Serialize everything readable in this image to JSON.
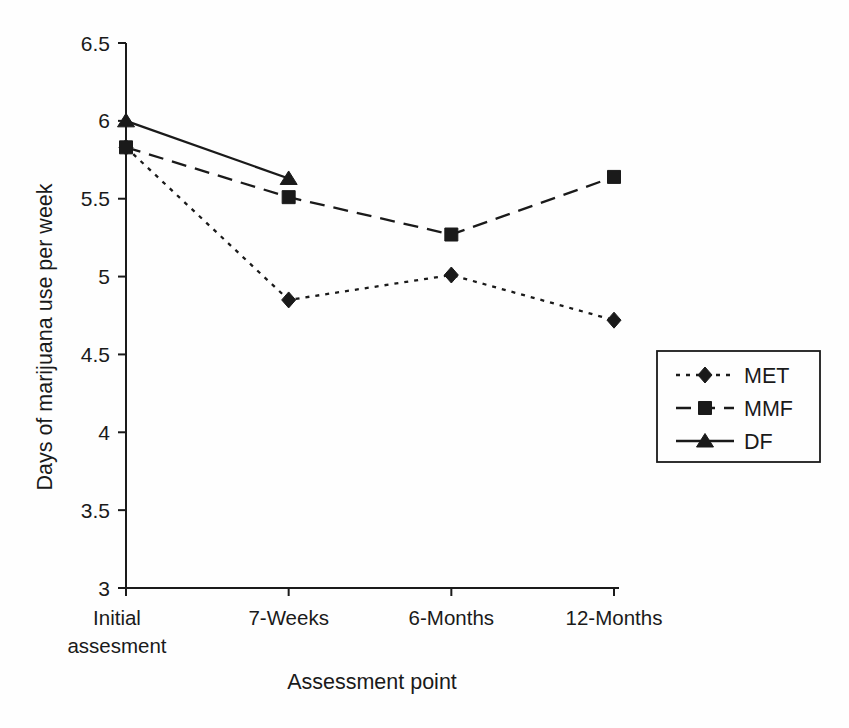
{
  "chart_data": {
    "type": "line",
    "title": "",
    "xlabel": "Assessment point",
    "ylabel": "Days of marijuana use per week",
    "categories": [
      [
        "Initial",
        "assesment"
      ],
      [
        "7-Weeks"
      ],
      [
        "6-Months"
      ],
      [
        "12-Months"
      ]
    ],
    "series": [
      {
        "name": "MET",
        "marker": "diamond",
        "dash": "4 6",
        "values": [
          5.83,
          4.85,
          5.01,
          4.72
        ]
      },
      {
        "name": "MMF",
        "marker": "square",
        "dash": "15 9",
        "values": [
          5.83,
          5.51,
          5.27,
          5.64
        ]
      },
      {
        "name": "DF",
        "marker": "triangle",
        "dash": "",
        "values": [
          6.0,
          5.63,
          null,
          null
        ]
      }
    ],
    "ylim": [
      3,
      6.5
    ],
    "ytick_step": 0.5,
    "ytick_labels": [
      "6.5",
      "6",
      "5.5",
      "5",
      "4.5",
      "4",
      "3.5",
      "3"
    ],
    "grid": false,
    "legend_position": "right",
    "legend_labels": [
      "MET",
      "MMF",
      "DF"
    ],
    "line_color": "#1a1a1a",
    "background_color": "#fefefe"
  }
}
